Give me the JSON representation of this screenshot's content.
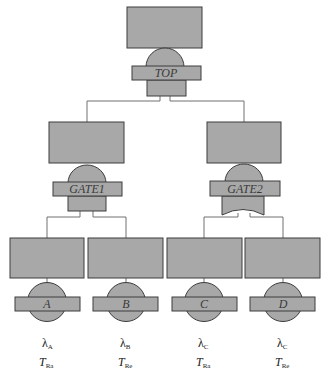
{
  "diagram": {
    "type": "fault-tree",
    "colors": {
      "fill": "#a8a8a8",
      "stroke": "#3c3c3c",
      "wire": "#707070",
      "background": "#ffffff"
    },
    "top": {
      "label": "TOP",
      "gate": "and"
    },
    "gates": [
      {
        "label": "GATE1",
        "gate": "and"
      },
      {
        "label": "GATE2",
        "gate": "or"
      }
    ],
    "basic_events": [
      {
        "label": "A",
        "rate_symbol": "λ",
        "rate_sub": "A",
        "time_symbol": "T",
        "time_sub": "Ra"
      },
      {
        "label": "B",
        "rate_symbol": "λ",
        "rate_sub": "B",
        "time_symbol": "T",
        "time_sub": "Re"
      },
      {
        "label": "C",
        "rate_symbol": "λ",
        "rate_sub": "C",
        "time_symbol": "T",
        "time_sub": "Ra"
      },
      {
        "label": "D",
        "rate_symbol": "λ",
        "rate_sub": "C",
        "time_symbol": "T",
        "time_sub": "Re"
      }
    ]
  }
}
